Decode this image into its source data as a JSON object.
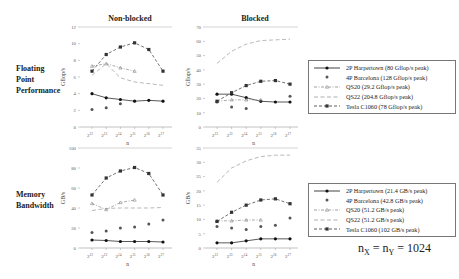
{
  "columns": {
    "left": "Non-blocked",
    "right": "Blocked"
  },
  "rows": {
    "top": [
      "Floating",
      "Point",
      "Performance"
    ],
    "bottom": [
      "Memory",
      "Bandwidth"
    ]
  },
  "formula": {
    "lhs": "n",
    "lhs_sub": "X",
    "mid": "n",
    "mid_sub": "Y",
    "value": "= 1024",
    "eq": "="
  },
  "legends": {
    "flops": [
      {
        "label": "2P Harpertown (80 Gflop/s peak)",
        "style": "solid-circle"
      },
      {
        "label": "4P Barcelona (128 Gflop/s peak)",
        "style": "marker-only"
      },
      {
        "label": "QS20 (29.2 Gflop/s peak)",
        "style": "dashdot-triangle"
      },
      {
        "label": "QS22 (204.8 Gflop/s peak)",
        "style": "dashed"
      },
      {
        "label": "Tesla C1060 (78 Gflop/s peak)",
        "style": "dashed-square"
      }
    ],
    "bandwidth": [
      {
        "label": "2P Harpertown (21.4 GB/s peak)",
        "style": "solid-circle"
      },
      {
        "label": "4P Barcelona (42.8 GB/s peak)",
        "style": "marker-only"
      },
      {
        "label": "QS20 (51.2 GB/s peak)",
        "style": "dashdot-triangle"
      },
      {
        "label": "QS22 (51.2 GB/s peak)",
        "style": "dashed"
      },
      {
        "label": "Tesla C1060 (102 GB/s peak)",
        "style": "dashed-square"
      }
    ]
  },
  "chart_data": [
    {
      "type": "line",
      "title": "Non-blocked",
      "row": "Floating Point Performance",
      "xlabel": "n",
      "ylabel": "Gflop/s",
      "categories": [
        "2^12",
        "2^13",
        "2^14",
        "2^15",
        "2^16",
        "2^17"
      ],
      "ylim": [
        0,
        12
      ],
      "yticks": [
        0,
        2,
        4,
        6,
        8,
        10,
        12
      ],
      "series": [
        {
          "name": "2P Harpertown (80 Gflop/s peak)",
          "values": [
            4.0,
            3.5,
            3.3,
            3.1,
            3.2,
            3.1
          ]
        },
        {
          "name": "4P Barcelona (128 Gflop/s peak)",
          "values": [
            2.1,
            2.3,
            2.8,
            null,
            null,
            null
          ]
        },
        {
          "name": "QS20 (29.2 Gflop/s peak)",
          "values": [
            7.3,
            7.6,
            7.1,
            6.7,
            null,
            null
          ]
        },
        {
          "name": "QS22 (204.8 Gflop/s peak)",
          "values": [
            6.2,
            7.6,
            5.9,
            5.4,
            5.2,
            5.0
          ]
        },
        {
          "name": "Tesla C1060 (78 Gflop/s peak)",
          "values": [
            6.7,
            8.7,
            9.6,
            10.1,
            9.3,
            6.7
          ]
        }
      ]
    },
    {
      "type": "line",
      "title": "Blocked",
      "row": "Floating Point Performance",
      "xlabel": "n",
      "ylabel": "Gflop/s",
      "categories": [
        "2^12",
        "2^13",
        "2^14",
        "2^15",
        "2^16",
        "2^17"
      ],
      "ylim": [
        0,
        70
      ],
      "yticks": [
        0,
        10,
        20,
        30,
        40,
        50,
        60,
        70
      ],
      "series": [
        {
          "name": "2P Harpertown (80 Gflop/s peak)",
          "values": [
            23,
            23,
            20.5,
            18,
            17.5,
            17.5
          ]
        },
        {
          "name": "4P Barcelona (128 Gflop/s peak)",
          "values": [
            17.5,
            14,
            13,
            null,
            null,
            21.5
          ]
        },
        {
          "name": "QS20 (29.2 Gflop/s peak)",
          "values": [
            18,
            19,
            19,
            19,
            null,
            null
          ]
        },
        {
          "name": "QS22 (204.8 Gflop/s peak)",
          "values": [
            44.5,
            53,
            58,
            60.5,
            61,
            61.5
          ]
        },
        {
          "name": "Tesla C1060 (78 Gflop/s peak)",
          "values": [
            18,
            24,
            29,
            32,
            32.5,
            30
          ]
        }
      ]
    },
    {
      "type": "line",
      "title": "Non-blocked",
      "row": "Memory Bandwidth",
      "xlabel": "n",
      "ylabel": "GB/s",
      "categories": [
        "2^12",
        "2^13",
        "2^14",
        "2^15",
        "2^16",
        "2^17"
      ],
      "ylim": [
        0,
        100
      ],
      "yticks": [
        0,
        20,
        40,
        60,
        80,
        100
      ],
      "series": [
        {
          "name": "2P Harpertown (21.4 GB/s peak)",
          "values": [
            8,
            7.5,
            6.5,
            6.5,
            6.5,
            6
          ]
        },
        {
          "name": "4P Barcelona (42.8 GB/s peak)",
          "values": [
            15.5,
            17,
            20,
            21,
            24,
            28
          ]
        },
        {
          "name": "QS20 (51.2 GB/s peak)",
          "values": [
            44.5,
            38.5,
            45.5,
            48,
            null,
            null
          ]
        },
        {
          "name": "QS22 (51.2 GB/s peak)",
          "values": [
            37.5,
            39.5,
            40,
            40,
            40,
            40.5
          ]
        },
        {
          "name": "Tesla C1060 (102 GB/s peak)",
          "values": [
            53,
            70,
            77,
            80.5,
            74.5,
            53
          ]
        }
      ]
    },
    {
      "type": "line",
      "title": "Blocked",
      "row": "Memory Bandwidth",
      "xlabel": "n",
      "ylabel": "GB/s",
      "categories": [
        "2^12",
        "2^13",
        "2^14",
        "2^15",
        "2^16",
        "2^17"
      ],
      "ylim": [
        0,
        35
      ],
      "yticks": [
        0,
        5,
        10,
        15,
        20,
        25,
        30,
        35
      ],
      "series": [
        {
          "name": "2P Harpertown (21.4 GB/s peak)",
          "values": [
            1.8,
            1.8,
            2.5,
            3.2,
            3.2,
            3.2
          ]
        },
        {
          "name": "4P Barcelona (42.8 GB/s peak)",
          "values": [
            7.5,
            7,
            6.5,
            7.5,
            8,
            10.5
          ]
        },
        {
          "name": "QS20 (51.2 GB/s peak)",
          "values": [
            9.5,
            9.5,
            9.8,
            9.8,
            null,
            null
          ]
        },
        {
          "name": "QS22 (51.2 GB/s peak)",
          "values": [
            23,
            28,
            30.5,
            32,
            32.5,
            32.5
          ]
        },
        {
          "name": "Tesla C1060 (102 GB/s peak)",
          "values": [
            9.3,
            12.5,
            15,
            16.8,
            17.2,
            15.5
          ]
        }
      ]
    }
  ]
}
